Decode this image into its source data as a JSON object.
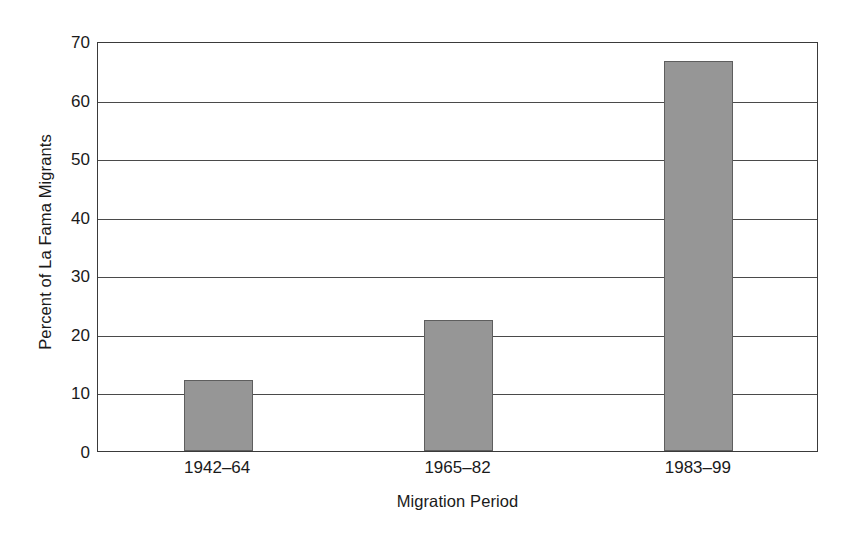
{
  "chart_data": {
    "type": "bar",
    "title": "",
    "subtitle": "",
    "xlabel": "Migration Period",
    "ylabel": "Percent of La Fama Migrants",
    "categories": [
      "1942–64",
      "1965–82",
      "1983–99"
    ],
    "values": [
      12.1,
      22.4,
      66.6
    ],
    "series": [
      {
        "name": "Percent of La Fama Migrants",
        "values": [
          12.1,
          22.4,
          66.6
        ]
      }
    ],
    "ylim": [
      0,
      70
    ],
    "xlim": [
      0,
      3
    ],
    "yticks": [
      0,
      10,
      20,
      30,
      40,
      50,
      60,
      70
    ],
    "ytick_labels": [
      "0",
      "10",
      "20",
      "30",
      "40",
      "50",
      "60",
      "70"
    ],
    "grid": "horizontal",
    "legend": "none",
    "legend_position": "none",
    "bar_color": "#969696",
    "bar_edge_color": "#5e5e5e",
    "axis_color": "#3a3a3a",
    "gridline_color": "#4a4a4a",
    "background_color": "#ffffff",
    "annotations": []
  }
}
